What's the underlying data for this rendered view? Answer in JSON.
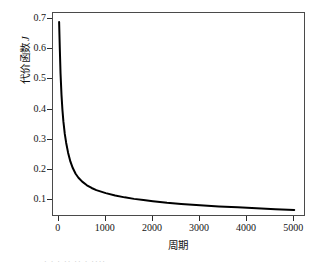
{
  "chart_data": {
    "type": "line",
    "title": "",
    "xlabel": "周期",
    "ylabel": "代价函数 J",
    "ylabel_text": "代价函数",
    "ylabel_symbol": "J",
    "xlim": [
      -120,
      5250
    ],
    "ylim": [
      0.045,
      0.72
    ],
    "xticks": [
      0,
      1000,
      2000,
      3000,
      4000,
      5000
    ],
    "xticklabels": [
      "0",
      "1000",
      "2000",
      "3000",
      "4000",
      "5000"
    ],
    "yticks": [
      0.1,
      0.2,
      0.3,
      0.4,
      0.5,
      0.6,
      0.7
    ],
    "yticklabels": [
      "0.1",
      "0.2",
      "0.3",
      "0.4",
      "0.5",
      "0.6",
      "0.7"
    ],
    "grid": false,
    "legend": false,
    "series": [
      {
        "name": "代价函数 J",
        "color": "#000000",
        "linewidth": 2.0,
        "x": [
          10,
          25,
          40,
          60,
          80,
          100,
          130,
          160,
          200,
          250,
          300,
          360,
          420,
          500,
          600,
          700,
          800,
          900,
          1000,
          1200,
          1400,
          1600,
          1800,
          2000,
          2300,
          2600,
          3000,
          3400,
          3800,
          4200,
          4600,
          5000
        ],
        "y": [
          0.69,
          0.6,
          0.52,
          0.45,
          0.4,
          0.362,
          0.32,
          0.29,
          0.258,
          0.228,
          0.207,
          0.188,
          0.175,
          0.162,
          0.15,
          0.141,
          0.134,
          0.129,
          0.124,
          0.116,
          0.11,
          0.105,
          0.101,
          0.097,
          0.092,
          0.088,
          0.084,
          0.08,
          0.077,
          0.074,
          0.071,
          0.068
        ]
      }
    ],
    "annotations": []
  },
  "caption": {
    "partial_text": "· · ·  ·· ··  ·  ····"
  }
}
